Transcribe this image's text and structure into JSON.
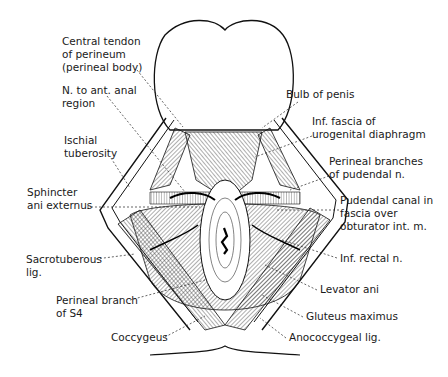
{
  "figure": {
    "labels": {
      "central_tendon": "Central tendon\nof perineum\n(perineal body)",
      "n_ant_anal": "N. to ant. anal\nregion",
      "ischial_tuberosity": "Ischial\ntuberosity",
      "sphincter_ani": "Sphincter\nani externus",
      "sacrotuberous": "Sacrotuberous\nlig.",
      "perineal_branch_s4": "Perineal branch\nof S4",
      "coccygeus": "Coccygeus",
      "bulb_of_penis": "Bulb of penis",
      "inf_fascia": "Inf. fascia of\nurogenital diaphragm",
      "perineal_branches": "Perineal branches\nof pudendal n.",
      "pudendal_canal": "Pudendal canal in\nfascia over\nobturator int. m.",
      "inf_rectal": "Inf. rectal n.",
      "levator_ani": "Levator ani",
      "gluteus_maximus": "Gluteus maximus",
      "anococcygeal": "Anococcygeal lig."
    }
  }
}
